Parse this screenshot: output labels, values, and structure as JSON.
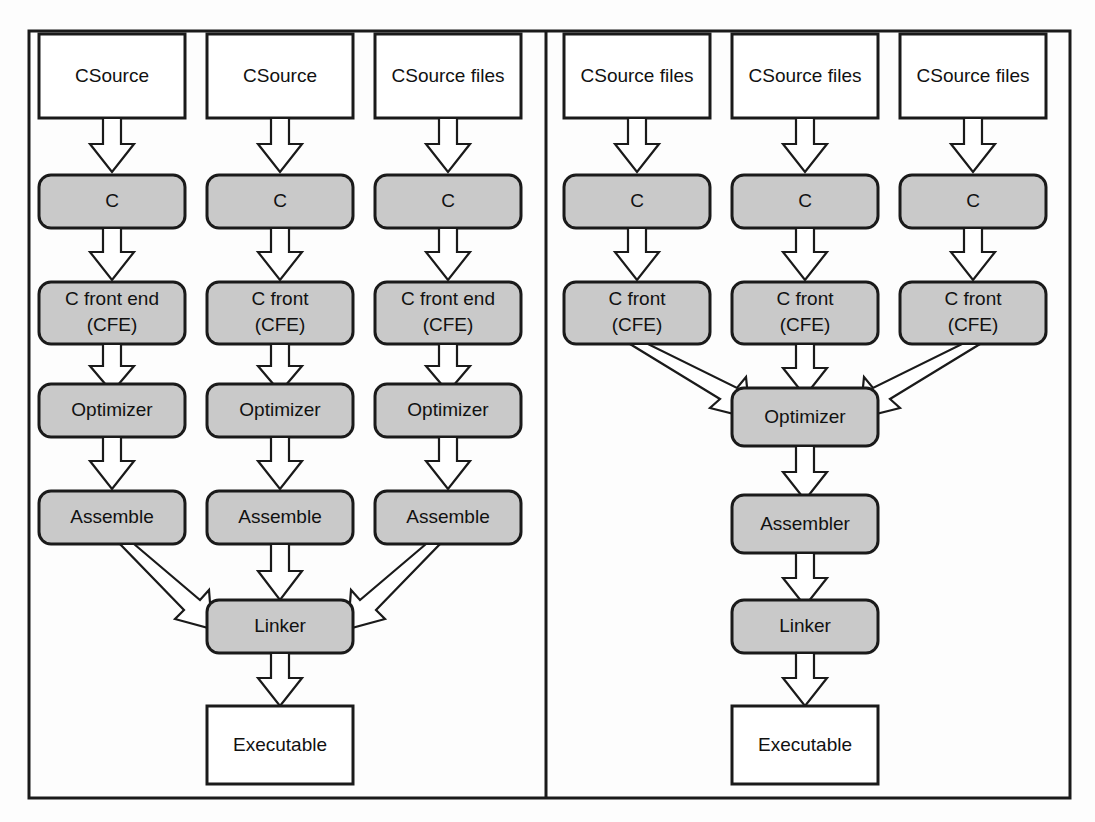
{
  "diagram": {
    "colors": {
      "process_fill": "#c9c9c9",
      "io_fill": "#ffffff",
      "stroke": "#1a1a1a",
      "background": "#fdfdfd"
    },
    "panels": [
      {
        "id": "left-panel",
        "name": "separate-compilation-panel",
        "columns": [
          {
            "id": "col-1",
            "nodes": [
              {
                "id": "l1-source",
                "label": "CSource",
                "shape": "rect",
                "fill": "io"
              },
              {
                "id": "l1-c",
                "label": "C",
                "shape": "rounded",
                "fill": "process"
              },
              {
                "id": "l1-cfe",
                "label": "C front end\n(CFE)",
                "line1": "C front end",
                "line2": "(CFE)",
                "shape": "rounded",
                "fill": "process"
              },
              {
                "id": "l1-opt",
                "label": "Optimizer",
                "shape": "rounded",
                "fill": "process"
              },
              {
                "id": "l1-asm",
                "label": "Assemble",
                "shape": "rounded",
                "fill": "process"
              }
            ]
          },
          {
            "id": "col-2",
            "nodes": [
              {
                "id": "l2-source",
                "label": "CSource",
                "shape": "rect",
                "fill": "io"
              },
              {
                "id": "l2-c",
                "label": "C",
                "shape": "rounded",
                "fill": "process"
              },
              {
                "id": "l2-cfe",
                "label": "C front\n(CFE)",
                "line1": "C front",
                "line2": "(CFE)",
                "shape": "rounded",
                "fill": "process"
              },
              {
                "id": "l2-opt",
                "label": "Optimizer",
                "shape": "rounded",
                "fill": "process"
              },
              {
                "id": "l2-asm",
                "label": "Assemble",
                "shape": "rounded",
                "fill": "process"
              }
            ]
          },
          {
            "id": "col-3",
            "nodes": [
              {
                "id": "l3-source",
                "label": "CSource files",
                "shape": "rect",
                "fill": "io"
              },
              {
                "id": "l3-c",
                "label": "C",
                "shape": "rounded",
                "fill": "process"
              },
              {
                "id": "l3-cfe",
                "label": "C front end\n(CFE)",
                "line1": "C front end",
                "line2": "(CFE)",
                "shape": "rounded",
                "fill": "process"
              },
              {
                "id": "l3-opt",
                "label": "Optimizer",
                "shape": "rounded",
                "fill": "process"
              },
              {
                "id": "l3-asm",
                "label": "Assemble",
                "shape": "rounded",
                "fill": "process"
              }
            ]
          }
        ],
        "merge_nodes": [
          {
            "id": "l-linker",
            "label": "Linker",
            "shape": "rounded",
            "fill": "process"
          },
          {
            "id": "l-exe",
            "label": "Executable",
            "shape": "rect",
            "fill": "io"
          }
        ]
      },
      {
        "id": "right-panel",
        "name": "shared-optimizer-panel",
        "columns": [
          {
            "id": "col-4",
            "nodes": [
              {
                "id": "r1-source",
                "label": "CSource files",
                "shape": "rect",
                "fill": "io"
              },
              {
                "id": "r1-c",
                "label": "C",
                "shape": "rounded",
                "fill": "process"
              },
              {
                "id": "r1-cfe",
                "label": "C front\n(CFE)",
                "line1": "C front",
                "line2": "(CFE)",
                "shape": "rounded",
                "fill": "process"
              }
            ]
          },
          {
            "id": "col-5",
            "nodes": [
              {
                "id": "r2-source",
                "label": "CSource files",
                "shape": "rect",
                "fill": "io"
              },
              {
                "id": "r2-c",
                "label": "C",
                "shape": "rounded",
                "fill": "process"
              },
              {
                "id": "r2-cfe",
                "label": "C front\n(CFE)",
                "line1": "C front",
                "line2": "(CFE)",
                "shape": "rounded",
                "fill": "process"
              }
            ]
          },
          {
            "id": "col-6",
            "nodes": [
              {
                "id": "r3-source",
                "label": "CSource files",
                "shape": "rect",
                "fill": "io"
              },
              {
                "id": "r3-c",
                "label": "C",
                "shape": "rounded",
                "fill": "process"
              },
              {
                "id": "r3-cfe",
                "label": "C front\n(CFE)",
                "line1": "C front",
                "line2": "(CFE)",
                "shape": "rounded",
                "fill": "process"
              }
            ]
          }
        ],
        "merge_nodes": [
          {
            "id": "r-opt",
            "label": "Optimizer",
            "shape": "rounded",
            "fill": "process"
          },
          {
            "id": "r-asm",
            "label": "Assembler",
            "shape": "rounded",
            "fill": "process"
          },
          {
            "id": "r-linker",
            "label": "Linker",
            "shape": "rounded",
            "fill": "process"
          },
          {
            "id": "r-exe",
            "label": "Executable",
            "shape": "rect",
            "fill": "io"
          }
        ]
      }
    ],
    "labels": {
      "csource": "CSource",
      "csource_files": "CSource files",
      "c": "C",
      "c_front_end": "C front end",
      "c_front": "C front",
      "cfe": "(CFE)",
      "optimizer": "Optimizer",
      "assemble": "Assemble",
      "assembler": "Assembler",
      "linker": "Linker",
      "executable": "Executable"
    }
  }
}
